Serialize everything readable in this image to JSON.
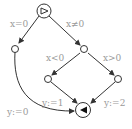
{
  "diagram": {
    "type": "control-flow-graph",
    "colors": {
      "stroke": "#333333",
      "label": "#9a9a9a",
      "background": "#ffffff"
    },
    "nodes": [
      {
        "id": "start",
        "kind": "start",
        "icon": "play-outline-icon"
      },
      {
        "id": "n_left",
        "kind": "state"
      },
      {
        "id": "n_mid",
        "kind": "state"
      },
      {
        "id": "n_lower_left",
        "kind": "state"
      },
      {
        "id": "n_lower_right",
        "kind": "state"
      },
      {
        "id": "end",
        "kind": "end",
        "icon": "reverse-filled-icon"
      }
    ],
    "edges": [
      {
        "from": "start",
        "to": "n_left",
        "label": "x=0"
      },
      {
        "from": "start",
        "to": "n_mid",
        "label": "x≠0"
      },
      {
        "from": "n_mid",
        "to": "n_lower_left",
        "label": "x<0"
      },
      {
        "from": "n_mid",
        "to": "n_lower_right",
        "label": "x>0"
      },
      {
        "from": "n_left",
        "to": "end",
        "label": "y:=0"
      },
      {
        "from": "n_lower_left",
        "to": "end",
        "label": "y:=1"
      },
      {
        "from": "n_lower_right",
        "to": "end",
        "label": "y:=2"
      }
    ]
  }
}
